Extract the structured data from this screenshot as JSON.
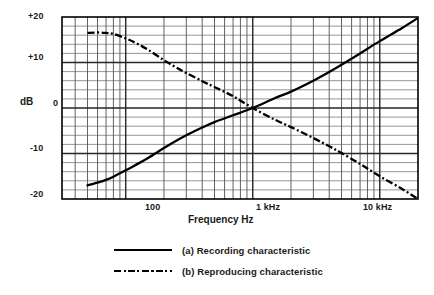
{
  "chart_data": {
    "type": "line",
    "title": "",
    "xlabel": "Frequency Hz",
    "ylabel": "dB",
    "xscale": "log",
    "xlim": [
      31.5,
      20000
    ],
    "ylim": [
      -20,
      20
    ],
    "grid": true,
    "xticks": [
      100,
      1000,
      10000
    ],
    "xticklabels": [
      "100",
      "1 kHz",
      "10 kHz"
    ],
    "yticks": [
      20,
      10,
      0,
      -10,
      -20
    ],
    "yticklabels": [
      "+20",
      "+10",
      "0",
      "-10",
      "-20"
    ],
    "y_minor_step": 2,
    "legend_position": "below",
    "series": [
      {
        "name": "(a) Recording characteristic",
        "style": "solid",
        "color": "#000000",
        "x": [
          50,
          60,
          70,
          80,
          100,
          120,
          150,
          200,
          250,
          300,
          400,
          500,
          700,
          1000,
          1500,
          2000,
          3000,
          4000,
          5000,
          7000,
          10000,
          15000,
          20000
        ],
        "y": [
          -17.0,
          -16.4,
          -15.8,
          -15.1,
          -13.7,
          -12.5,
          -11.0,
          -8.8,
          -7.2,
          -6.0,
          -4.3,
          -3.1,
          -1.6,
          0.0,
          2.2,
          3.6,
          6.0,
          7.9,
          9.5,
          12.0,
          14.7,
          17.6,
          19.8
        ]
      },
      {
        "name": "(b) Reproducing characteristic",
        "style": "dash-dot",
        "color": "#000000",
        "x": [
          50,
          60,
          70,
          80,
          100,
          120,
          150,
          200,
          250,
          300,
          400,
          500,
          700,
          1000,
          1500,
          2000,
          3000,
          4000,
          5000,
          7000,
          10000,
          15000,
          20000
        ],
        "y": [
          16.5,
          16.6,
          16.5,
          16.3,
          15.3,
          14.3,
          12.8,
          10.5,
          8.9,
          7.7,
          5.9,
          4.6,
          2.6,
          0.0,
          -2.6,
          -4.2,
          -6.6,
          -8.4,
          -9.9,
          -12.3,
          -15.0,
          -17.8,
          -20.0
        ]
      }
    ],
    "annotations": []
  },
  "axis": {
    "y_plus20": "+20",
    "y_plus10": "+10",
    "y_zero": "0",
    "y_minus10": "-10",
    "y_minus20": "-20",
    "y_title": "dB",
    "x_100": "100",
    "x_1k": "1 kHz",
    "x_10k": "10 kHz",
    "x_title": "Frequency Hz"
  },
  "legend": {
    "items": [
      {
        "label": "(a) Recording characteristic",
        "style": "solid"
      },
      {
        "label": "(b) Reproducing characteristic",
        "style": "dash-dot"
      }
    ]
  }
}
